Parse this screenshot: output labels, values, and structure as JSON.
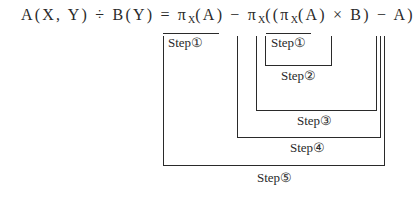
{
  "formula": {
    "lhs": "A(X, Y) ÷ B(Y)",
    "eq": " = ",
    "pi1": "π",
    "sub1": "X",
    "arg1": "(A) − ",
    "pi2": "π",
    "sub2": "X",
    "mid": "((",
    "pi3": "π",
    "sub3": "X",
    "arg3": "(A) × B) − A)"
  },
  "steps": [
    {
      "id": "step1-outer",
      "label": "Step①"
    },
    {
      "id": "step1-inner",
      "label": "Step①"
    },
    {
      "id": "step2",
      "label": "Step②"
    },
    {
      "id": "step3",
      "label": "Step③"
    },
    {
      "id": "step4",
      "label": "Step④"
    },
    {
      "id": "step5",
      "label": "Step⑤"
    }
  ]
}
